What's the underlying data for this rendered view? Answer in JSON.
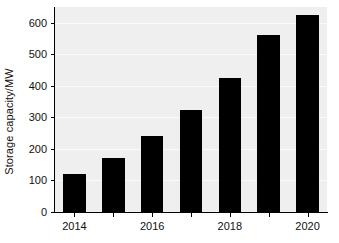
{
  "chart_data": {
    "type": "bar",
    "title": "",
    "xlabel": "",
    "ylabel": "Storage capacity/MW",
    "categories": [
      "2014",
      "2015",
      "2016",
      "2017",
      "2018",
      "2019",
      "2020"
    ],
    "values": [
      120,
      170,
      240,
      325,
      425,
      560,
      625
    ],
    "series": [
      {
        "name": "Storage capacity",
        "values": [
          120,
          170,
          240,
          325,
          425,
          560,
          625
        ]
      }
    ],
    "ylim": [
      0,
      650
    ],
    "xtick_labels": [
      "2014",
      "2016",
      "2018",
      "2020"
    ],
    "ytick_labels": [
      "0",
      "100",
      "200",
      "300",
      "400",
      "500",
      "600"
    ],
    "ytick_values": [
      0,
      100,
      200,
      300,
      400,
      500,
      600
    ],
    "grid": true,
    "grid_axis": "y",
    "legend": "none",
    "bar_color": "#000000",
    "plot_background": "#efefef",
    "figure_background": "#ffffff",
    "axis_color": "#000000",
    "gridline_color": "#fbfbfb"
  }
}
